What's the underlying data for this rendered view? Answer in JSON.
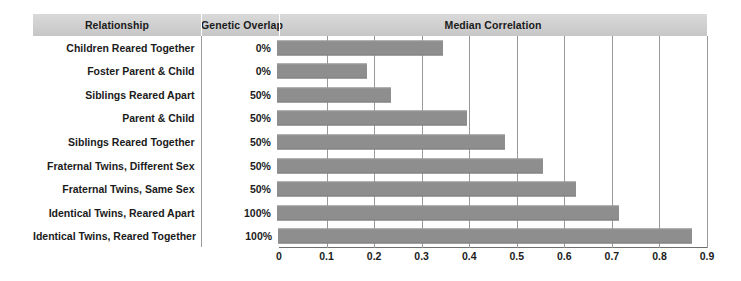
{
  "table": {
    "columns": [
      "Relationship",
      "Genetic Overlap",
      "Median Correlation"
    ]
  },
  "chart_data": {
    "type": "bar",
    "orientation": "horizontal",
    "title": "Median Correlation",
    "xlabel": "",
    "ylabel": "",
    "xlim": [
      0,
      0.9
    ],
    "grid": true,
    "legend": null,
    "bar_color": "#8e8e8e",
    "header_color": "#cfcfcf",
    "categories": [
      "Children Reared Together",
      "Foster Parent & Child",
      "Siblings Reared Apart",
      "Parent & Child",
      "Siblings Reared Together",
      "Fraternal Twins, Different Sex",
      "Fraternal Twins, Same Sex",
      "Identical Twins, Reared Apart",
      "Identical Twins, Reared Together"
    ],
    "genetic_overlap": [
      "0%",
      "0%",
      "50%",
      "50%",
      "50%",
      "50%",
      "50%",
      "100%",
      "100%"
    ],
    "values": [
      0.35,
      0.19,
      0.24,
      0.4,
      0.48,
      0.56,
      0.63,
      0.72,
      0.87
    ],
    "xticks": [
      0,
      0.1,
      0.2,
      0.3,
      0.4,
      0.5,
      0.6,
      0.7,
      0.8,
      0.9
    ],
    "xtick_labels": [
      "0",
      "0.1",
      "0.2",
      "0.3",
      "0.4",
      "0.5",
      "0.6",
      "0.7",
      "0.8",
      "0.9"
    ]
  }
}
